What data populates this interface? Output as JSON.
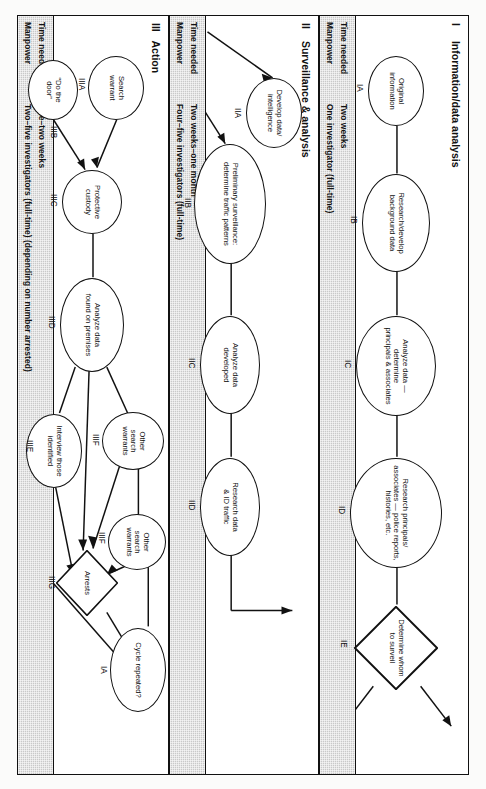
{
  "document": {
    "title": "Investigation process flowchart",
    "orientation": "landscape chart printed sideways on portrait page"
  },
  "sections": [
    {
      "roman": "I",
      "title": "Information/data analysis",
      "resources": {
        "time_label": "Time needed",
        "manpower_label": "Manpower",
        "time_value": "Two weeks",
        "manpower_value": "One investigator (full-time)"
      },
      "nodes": [
        {
          "id": "IA",
          "shape": "ellipse",
          "lines": [
            "Original",
            "information"
          ]
        },
        {
          "id": "IB",
          "shape": "ellipse",
          "lines": [
            "Research/develop",
            "background data"
          ]
        },
        {
          "id": "IC",
          "shape": "ellipse",
          "lines": [
            "Analyze data —",
            "determine",
            "principals & associates"
          ]
        },
        {
          "id": "ID",
          "shape": "ellipse",
          "lines": [
            "Research principals/",
            "associates — police reports,",
            "histories, etc."
          ]
        },
        {
          "id": "IE",
          "shape": "diamond",
          "lines": [
            "Determine whom",
            "to surveil"
          ]
        }
      ]
    },
    {
      "roman": "II",
      "title": "Surveillance & analysis",
      "resources": {
        "time_label": "Time needed",
        "manpower_label": "Manpower",
        "time_value": "Two weeks–one month",
        "manpower_value": "Four–five investigators (full-time)"
      },
      "nodes": [
        {
          "id": "IIA",
          "shape": "ellipse",
          "lines": [
            "Develop data/",
            "intelligence"
          ]
        },
        {
          "id": "IIB",
          "shape": "ellipse",
          "lines": [
            "Preliminary surveillance:",
            "determine traffic patterns"
          ]
        },
        {
          "id": "IIC",
          "shape": "ellipse",
          "lines": [
            "Analyze data",
            "developed"
          ]
        },
        {
          "id": "IID",
          "shape": "ellipse",
          "lines": [
            "Research data",
            "& ID traffic"
          ]
        }
      ]
    },
    {
      "roman": "III",
      "title": "Action",
      "resources": {
        "time_label": "Time needed",
        "manpower_label": "Manpower",
        "time_value": "One–two weeks",
        "manpower_value": "Two–five investigators (full-time) (depending on number arrested)"
      },
      "nodes": [
        {
          "id": "IIIA",
          "shape": "ellipse",
          "lines": [
            "Search",
            "warrant"
          ]
        },
        {
          "id": "IIIB",
          "shape": "ellipse",
          "lines": [
            "“Do the",
            "door”"
          ]
        },
        {
          "id": "IIIC",
          "shape": "ellipse",
          "lines": [
            "Protective",
            "custody"
          ]
        },
        {
          "id": "IIID",
          "shape": "ellipse",
          "lines": [
            "Analyze data",
            "found on premises"
          ]
        },
        {
          "id": "IIIE",
          "shape": "ellipse",
          "lines": [
            "Interview those",
            "identified"
          ]
        },
        {
          "id": "IIIF",
          "shape": "ellipse",
          "lines": [
            "Other",
            "search",
            "warrants"
          ]
        },
        {
          "id": "IIIF2",
          "shape": "ellipse",
          "label_text": "IIIF",
          "lines": [
            "Other",
            "search",
            "warrants"
          ]
        },
        {
          "id": "IIIG",
          "shape": "diamond",
          "lines": [
            "Arrests"
          ]
        },
        {
          "id": "IA",
          "shape": "ellipse",
          "lines": [
            "Cycle repeated?"
          ]
        }
      ]
    }
  ],
  "colors": {
    "ink": "#111111",
    "band_fill": "#ffffff",
    "resource_band": "#c9c9c9",
    "page": "#fbfbfa"
  }
}
